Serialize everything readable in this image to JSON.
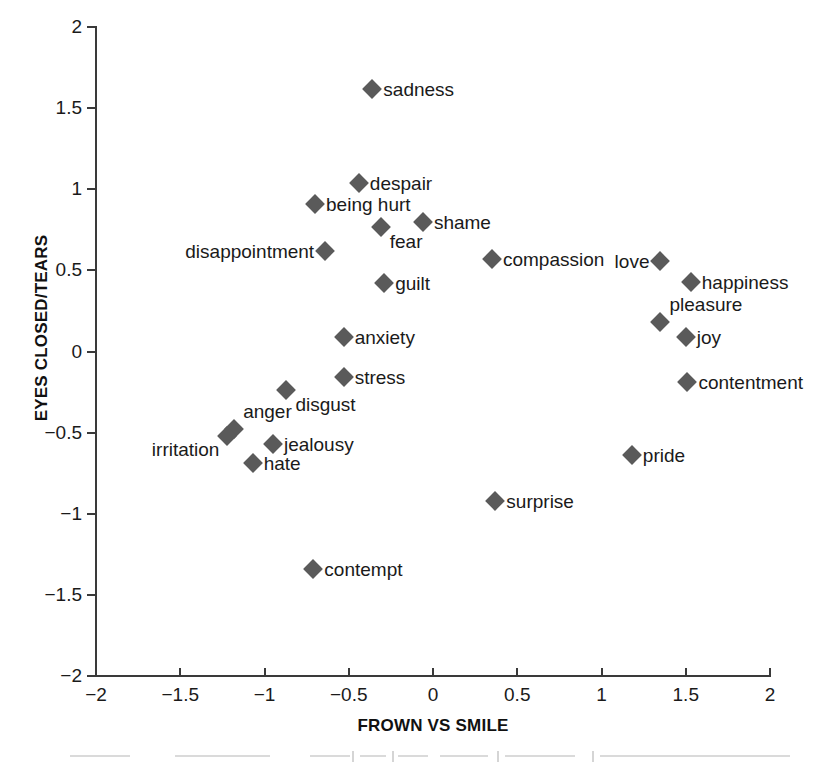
{
  "chart_data": {
    "type": "scatter",
    "title": "",
    "xlabel": "FROWN VS SMILE",
    "ylabel": "EYES CLOSED/TEARS",
    "xlim": [
      -2,
      2
    ],
    "ylim": [
      -2,
      2
    ],
    "xticks": [
      "-2",
      "-1.5",
      "-1",
      "-0.5",
      "0",
      "0.5",
      "1",
      "1.5",
      "2"
    ],
    "xtick_values": [
      -2,
      -1.5,
      -1,
      -0.5,
      0,
      0.5,
      1,
      1.5,
      2
    ],
    "yticks": [
      "2",
      "1.5",
      "1",
      "0.5",
      "0",
      "-0.5",
      "-1",
      "-1.5",
      "-2"
    ],
    "ytick_values": [
      2,
      1.5,
      1,
      0.5,
      0,
      -0.5,
      -1,
      -1.5,
      -2
    ],
    "grid": false,
    "legend": false,
    "marker": "diamond",
    "marker_color": "#5a5a5a",
    "axis_color": "#3a3a3a",
    "points": [
      {
        "label": "sadness",
        "x": -0.36,
        "y": 1.62,
        "label_pos": "right"
      },
      {
        "label": "despair",
        "x": -0.44,
        "y": 1.04,
        "label_pos": "right"
      },
      {
        "label": "being hurt",
        "x": -0.7,
        "y": 0.91,
        "label_pos": "right"
      },
      {
        "label": "shame",
        "x": -0.06,
        "y": 0.8,
        "label_pos": "right"
      },
      {
        "label": "fear",
        "x": -0.31,
        "y": 0.77,
        "label_pos": "below-right"
      },
      {
        "label": "disappointment",
        "x": -0.64,
        "y": 0.62,
        "label_pos": "left"
      },
      {
        "label": "compassion",
        "x": 0.35,
        "y": 0.57,
        "label_pos": "right"
      },
      {
        "label": "love",
        "x": 1.35,
        "y": 0.56,
        "label_pos": "left"
      },
      {
        "label": "happiness",
        "x": 1.53,
        "y": 0.43,
        "label_pos": "right"
      },
      {
        "label": "guilt",
        "x": -0.29,
        "y": 0.42,
        "label_pos": "right"
      },
      {
        "label": "pleasure",
        "x": 1.35,
        "y": 0.18,
        "label_pos": "above"
      },
      {
        "label": "joy",
        "x": 1.5,
        "y": 0.09,
        "label_pos": "right"
      },
      {
        "label": "anxiety",
        "x": -0.53,
        "y": 0.09,
        "label_pos": "right"
      },
      {
        "label": "stress",
        "x": -0.53,
        "y": -0.16,
        "label_pos": "right"
      },
      {
        "label": "contentment",
        "x": 1.51,
        "y": -0.19,
        "label_pos": "right"
      },
      {
        "label": "disgust",
        "x": -0.87,
        "y": -0.24,
        "label_pos": "below-right"
      },
      {
        "label": "anger",
        "x": -1.18,
        "y": -0.48,
        "label_pos": "above"
      },
      {
        "label": "irritation",
        "x": -1.22,
        "y": -0.52,
        "label_pos": "below-left"
      },
      {
        "label": "jealousy",
        "x": -0.95,
        "y": -0.57,
        "label_pos": "right"
      },
      {
        "label": "pride",
        "x": 1.18,
        "y": -0.64,
        "label_pos": "right"
      },
      {
        "label": "hate",
        "x": -1.07,
        "y": -0.69,
        "label_pos": "right"
      },
      {
        "label": "surprise",
        "x": 0.37,
        "y": -0.92,
        "label_pos": "right"
      },
      {
        "label": "contempt",
        "x": -0.71,
        "y": -1.34,
        "label_pos": "right"
      }
    ]
  }
}
